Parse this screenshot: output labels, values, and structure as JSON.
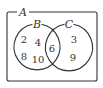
{
  "diagram": {
    "type": "venn",
    "universal_set": {
      "label": "A"
    },
    "sets": [
      {
        "label": "B",
        "only": [
          "2",
          "4",
          "8",
          "10"
        ]
      },
      {
        "label": "C",
        "only": [
          "3",
          "9"
        ]
      }
    ],
    "intersection": [
      "6"
    ],
    "colors": {
      "stroke": "#333333",
      "background": "#ffffff"
    }
  }
}
